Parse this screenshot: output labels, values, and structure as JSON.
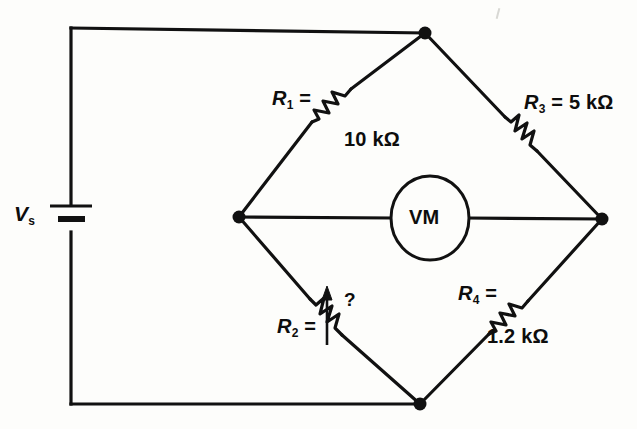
{
  "diagram": {
    "background_color": "#fdfdfb",
    "line_color": "#111111",
    "labels": {
      "source": {
        "symbol": "V",
        "subscript": "s",
        "text": "Vs"
      },
      "r1": {
        "symbol": "R",
        "subscript": "1",
        "suffix": " =",
        "value": "10 kΩ"
      },
      "r2": {
        "symbol": "R",
        "subscript": "2",
        "suffix": " =",
        "value": "?"
      },
      "r3": {
        "symbol": "R",
        "subscript": "3",
        "suffix": " = 5 kΩ",
        "value": "5 kΩ"
      },
      "r4": {
        "symbol": "R",
        "subscript": "4",
        "suffix": " =",
        "value": "1.2 kΩ"
      },
      "meter": "VM"
    },
    "components": [
      {
        "name": "voltage-source",
        "type": "battery",
        "label": "Vs"
      },
      {
        "name": "resistor-r1",
        "type": "resistor",
        "label": "R1 =",
        "value": "10 kΩ"
      },
      {
        "name": "resistor-r2",
        "type": "variable-resistor",
        "label": "R2 =",
        "value": "?"
      },
      {
        "name": "resistor-r3",
        "type": "resistor",
        "label": "R3 = 5 kΩ",
        "value": "5 kΩ"
      },
      {
        "name": "resistor-r4",
        "type": "resistor",
        "label": "R4 =",
        "value": "1.2 kΩ"
      },
      {
        "name": "voltmeter",
        "type": "meter",
        "label": "VM"
      }
    ],
    "nodes": [
      {
        "name": "node-top",
        "x": 425,
        "y": 33
      },
      {
        "name": "node-left",
        "x": 239,
        "y": 217
      },
      {
        "name": "node-right",
        "x": 602,
        "y": 219
      },
      {
        "name": "node-bottom",
        "x": 420,
        "y": 404
      }
    ]
  }
}
